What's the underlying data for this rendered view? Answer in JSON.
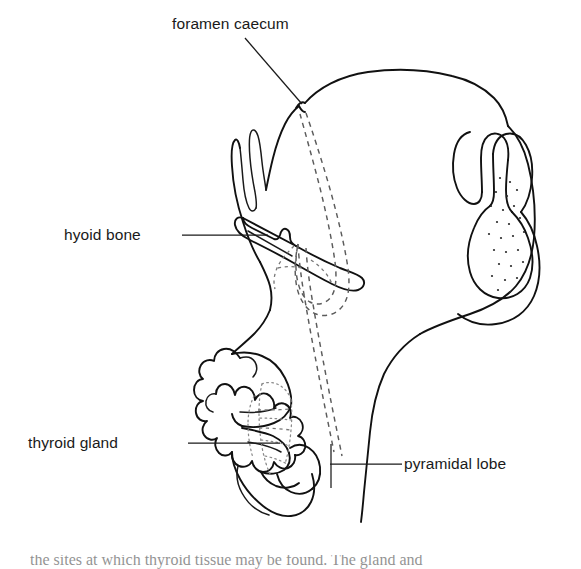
{
  "figure": {
    "kind": "anatomical-line-drawing",
    "background_color": "#ffffff",
    "ink_color": "#111111",
    "dashed_color": "#5b5b5b"
  },
  "labels": {
    "foramen_caecum": "foramen caecum",
    "hyoid_bone": "hyoid bone",
    "thyroid_gland": "thyroid gland",
    "pyramidal_lobe": "pyramidal lobe"
  },
  "label_positions": {
    "foramen_caecum": {
      "x": 172,
      "y": 29,
      "anchor": "start"
    },
    "hyoid_bone": {
      "x": 64,
      "y": 240,
      "anchor": "start"
    },
    "thyroid_gland": {
      "x": 28,
      "y": 448,
      "anchor": "start"
    },
    "pyramidal_lobe": {
      "x": 404,
      "y": 469,
      "anchor": "start"
    }
  },
  "leader_lines": [
    {
      "name": "foramen-caecum-leader",
      "points": "245,38 302,104"
    },
    {
      "name": "hyoid-bone-leader",
      "points": "182,235 268,235"
    },
    {
      "name": "thyroid-gland-leader",
      "points": "188,443 280,443"
    },
    {
      "name": "pyramidal-lobe-leader",
      "points": "330,464 402,464"
    }
  ],
  "structures": [
    {
      "name": "tongue-and-floor-of-mouth",
      "style": "solid-outline"
    },
    {
      "name": "foramen-caecum-notch",
      "style": "solid-outline"
    },
    {
      "name": "thyroglossal-duct-tract",
      "style": "dashed"
    },
    {
      "name": "hyoid-bone",
      "style": "solid-outline"
    },
    {
      "name": "epiglottis-and-larynx",
      "style": "solid-outline-stippled"
    },
    {
      "name": "thyroid-cartilage",
      "style": "solid-outline"
    },
    {
      "name": "cricoid-cartilage",
      "style": "solid-outline"
    },
    {
      "name": "tracheal-rings",
      "style": "dotted"
    },
    {
      "name": "thyroid-gland-lobe",
      "style": "scalloped-outline"
    },
    {
      "name": "pyramidal-lobe",
      "style": "solid-outline"
    },
    {
      "name": "neck-skin-contour",
      "style": "solid-outline"
    }
  ],
  "caption": {
    "text": "the sites at which thyroid tissue may be found.  The gland and"
  }
}
